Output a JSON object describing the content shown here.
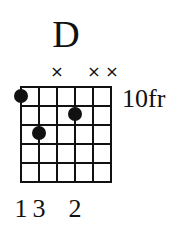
{
  "chord": {
    "name": "D",
    "base_fret_label": "10fr",
    "base_fret": 10,
    "strings": 6,
    "frets_shown": 5,
    "string_order": "low E (6) on left to high E (1) on right",
    "mute_symbol": "×",
    "muted_strings": [
      4,
      2,
      1
    ],
    "dots": [
      {
        "string": 6,
        "fret": 1,
        "finger": "1"
      },
      {
        "string": 5,
        "fret": 3,
        "finger": "3"
      },
      {
        "string": 3,
        "fret": 2,
        "finger": "2"
      }
    ],
    "fingers_row": [
      {
        "string": 6,
        "label": "1"
      },
      {
        "string": 5,
        "label": "3"
      },
      {
        "string": 3,
        "label": "2"
      }
    ]
  }
}
